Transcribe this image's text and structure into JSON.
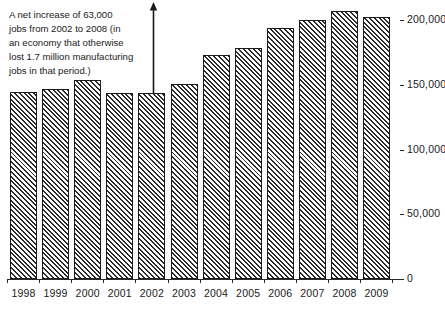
{
  "chart_data": {
    "type": "bar",
    "title": "",
    "subtitle": "",
    "xlabel": "",
    "ylabel": "",
    "categories": [
      "1998",
      "1999",
      "2000",
      "2001",
      "2002",
      "2003",
      "2004",
      "2005",
      "2006",
      "2007",
      "2008",
      "2009"
    ],
    "values": [
      144500,
      146700,
      153700,
      143700,
      143700,
      150600,
      173000,
      178400,
      193800,
      200000,
      206900,
      202300
    ],
    "ylim": [
      0,
      215000
    ],
    "ytick_values": [
      0,
      50000,
      100000,
      150000,
      200000
    ],
    "ytick_labels": [
      "0",
      "50,000",
      "100,000",
      "150,000",
      "200,000"
    ],
    "grid": false,
    "legend": false,
    "legend_position": "none",
    "bar_style": {
      "fill": "diagonal-hatch",
      "hatch_color": "#2b2b2b",
      "background": "#ffffff",
      "border_color": "#1a1a1a"
    },
    "annotations": [
      {
        "id": "net-increase-note",
        "text": "A net increase of 63,000 jobs from 2002 to 2008 (in an economy that otherwise lost 1.7 million manufacturing jobs in that period.)",
        "arrow": "up-arrow-from-2002-bar"
      }
    ]
  },
  "annotation": {
    "line1": "A net increase of 63,000",
    "line2": "jobs from 2002 to 2008 (in",
    "line3": "an economy that otherwise",
    "line4": "lost 1.7 million manufacturing",
    "line5": "jobs in that period.)"
  },
  "axis": {
    "y_tick_labels": [
      "200,000",
      "150,000",
      "100,000",
      "50,000",
      "0"
    ],
    "x_tick_labels": [
      "1998",
      "1999",
      "2000",
      "2001",
      "2002",
      "2003",
      "2004",
      "2005",
      "2006",
      "2007",
      "2008",
      "2009"
    ]
  },
  "colors": {
    "ink": "#1a1a1a",
    "hatch": "#2b2b2b",
    "background": "#ffffff"
  }
}
